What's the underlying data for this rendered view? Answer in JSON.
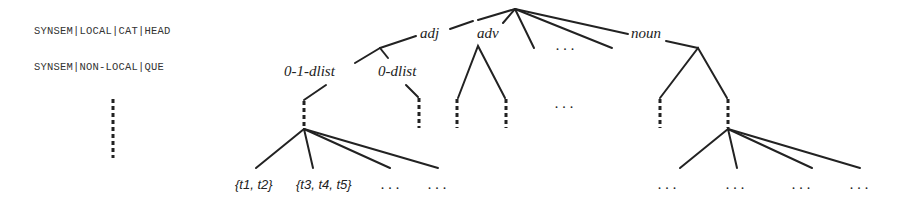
{
  "feature_paths": [
    {
      "label": "SYNSEM|LOCAL|CAT|HEAD"
    },
    {
      "label": "SYNSEM|NON-LOCAL|QUE"
    }
  ],
  "tree": {
    "level1_labels": {
      "adj": "adj",
      "adv": "adv",
      "noun": "noun",
      "ellipsis": ". . ."
    },
    "level2_labels": {
      "zero_one_dlist": "0-1-dlist",
      "zero_dlist": "0-dlist",
      "ellipsis": ". . ."
    },
    "leaves": {
      "t1_t2": "{t1, t2}",
      "t3_t4_t5": "{t3, t4, t5}",
      "ellipsis_a": ". . .",
      "ellipsis_b": ". . .",
      "right_ellipsis_1": ". . .",
      "right_ellipsis_2": ". . .",
      "right_ellipsis_3": ". . .",
      "right_ellipsis_4": ". . ."
    }
  }
}
